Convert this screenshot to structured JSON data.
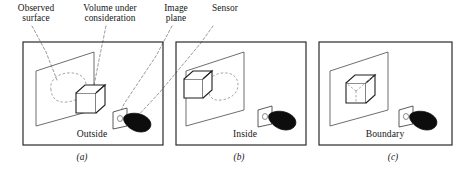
{
  "figure": {
    "kind": "line-diagram",
    "background_color": "#ffffff",
    "ink_color": "#1a1a1a",
    "dash_color": "#8a8a8a",
    "sensor_color": "#0d0d0d"
  },
  "callouts": [
    {
      "id": "observed-surface",
      "text": "Observed\nsurface"
    },
    {
      "id": "volume-under-consideration",
      "text": "Volume under\nconsideration"
    },
    {
      "id": "image-plane",
      "text": "Image\nplane"
    },
    {
      "id": "sensor",
      "text": "Sensor"
    }
  ],
  "panels": [
    {
      "id": "a",
      "caption": "Outside",
      "sub_caption": "(a)"
    },
    {
      "id": "b",
      "caption": "Inside",
      "sub_caption": "(b)"
    },
    {
      "id": "c",
      "caption": "Boundary",
      "sub_caption": "(c)"
    }
  ]
}
